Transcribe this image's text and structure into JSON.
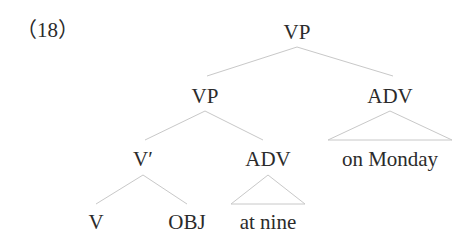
{
  "example_number": "（18）",
  "tree": {
    "root": {
      "label": "VP"
    },
    "vp_inner": {
      "label": "VP"
    },
    "adv_right": {
      "label": "ADV"
    },
    "v_bar": {
      "label": "V′"
    },
    "adv_mid": {
      "label": "ADV"
    },
    "v": {
      "label": "V"
    },
    "obj": {
      "label": "OBJ"
    },
    "at_nine": {
      "label": "at nine"
    },
    "on_monday": {
      "label": "on Monday"
    }
  },
  "colors": {
    "text": "#2b2b2b",
    "edges": "#c8c8c8",
    "background": "#ffffff"
  }
}
